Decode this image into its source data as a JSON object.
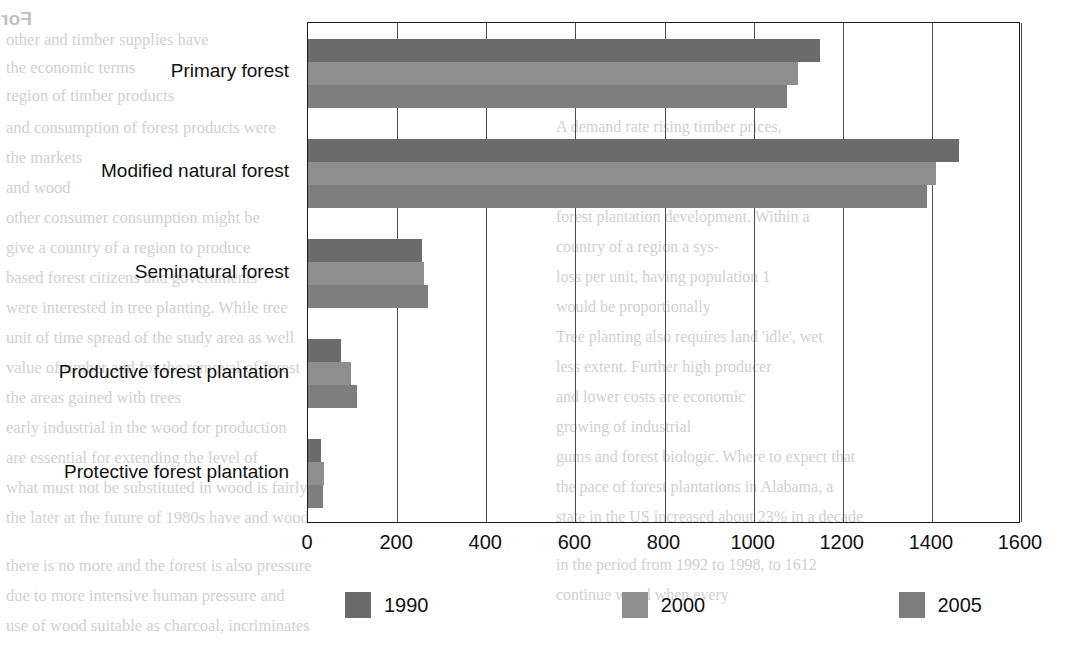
{
  "chart_data": {
    "type": "bar",
    "orientation": "horizontal",
    "title": "",
    "xlabel": "",
    "ylabel": "",
    "xlim": [
      0,
      1600
    ],
    "xticks": [
      0,
      200,
      400,
      600,
      800,
      1000,
      1200,
      1400,
      1600
    ],
    "grid": true,
    "legend_position": "bottom",
    "categories": [
      "Primary forest",
      "Modified natural forest",
      "Seminatural forest",
      "Productive forest plantation",
      "Protective forest plantation"
    ],
    "series": [
      {
        "name": "1990",
        "color": "#6b6b6b",
        "values": [
          1150,
          1460,
          255,
          75,
          30
        ]
      },
      {
        "name": "2000",
        "color": "#8e8e8e",
        "values": [
          1100,
          1410,
          260,
          97,
          36
        ]
      },
      {
        "name": "2005",
        "color": "#7e7e7e",
        "values": [
          1075,
          1390,
          270,
          110,
          33
        ]
      }
    ]
  },
  "axis": {
    "tick_labels": [
      "0",
      "200",
      "400",
      "600",
      "800",
      "1000",
      "1200",
      "1400",
      "1600"
    ]
  },
  "legend": {
    "entries": [
      {
        "label": "1990",
        "color": "#6b6b6b"
      },
      {
        "label": "2000",
        "color": "#8e8e8e"
      },
      {
        "label": "2005",
        "color": "#7e7e7e"
      }
    ]
  },
  "page_bleed": {
    "title": "Forests and Plantations",
    "left_column": [
      "other and timber supplies have",
      "the economic terms",
      "region of timber products",
      "and consumption of forest products were",
      "the markets",
      "and wood",
      "other consumer consumption might be",
      "give a country of a region to produce",
      "based forest citizens and governments",
      "were interested in tree planting. While tree",
      "unit of time spread of the study area as well",
      "value of timber and for the removal of forest",
      "the areas gained with trees",
      "early industrial in the wood for production",
      "are essential for extending the level of",
      "what must not be substituted in wood is fairly",
      "the later at the future of 1980s have and wood",
      "there is no more and the forest is also pressure",
      "due to more intensive human pressure and",
      "use of wood suitable as charcoal, incriminates"
    ],
    "right_column": [
      "A demand rate rising timber prices,",
      "ing to forest plantation devel-",
      "their own primary forest devel-",
      "forest plantation development. Within a",
      "country of a region a sys-",
      "loss per unit, having population 1",
      "would be proportionally",
      "Tree planting also requires land 'idle', wet",
      "less extent. Further high producer",
      "and lower costs are economic",
      "growing of industrial",
      "gums and forest biologic. Where to expect that",
      "the pace of forest plantations in Alabama, a",
      "state in the US increased about 23% in a decade",
      "in the period from 1992 to 1998, to 1612",
      "continue wood when every"
    ]
  }
}
